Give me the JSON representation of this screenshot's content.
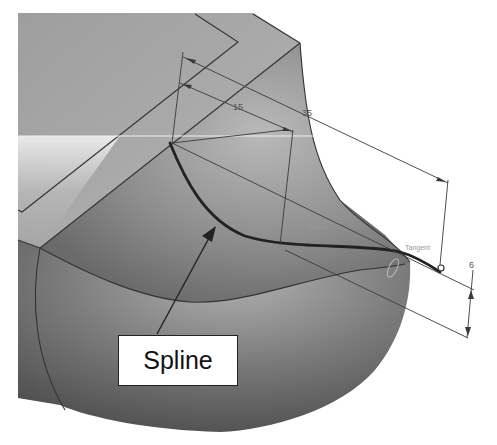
{
  "figure": {
    "callout": {
      "label": "Spline"
    },
    "dimensions": [
      {
        "id": "dim-15",
        "value": "15"
      },
      {
        "id": "dim-35",
        "value": "35"
      },
      {
        "id": "dim-6",
        "value": "6"
      }
    ],
    "annotations": {
      "spline_tag": "Spline",
      "tangency_tag": "Tangent"
    },
    "colors": {
      "background": "#ffffff",
      "top_face": "#a9a9a9",
      "side_face_dark": "#6e6e6e",
      "blend_surface": "#8c8c8c",
      "spline_curve": "#2a2a2a",
      "dimension_line": "#3a3a3a"
    }
  }
}
